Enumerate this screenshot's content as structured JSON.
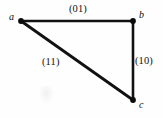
{
  "figure": {
    "background_color": "#fefefe",
    "stroke_color": "#111111",
    "vertex_color": "#0b0b0b"
  },
  "vertices": [
    {
      "id": "a",
      "label": "a",
      "x": 21,
      "y": 21
    },
    {
      "id": "b",
      "label": "b",
      "x": 133,
      "y": 21
    },
    {
      "id": "c",
      "label": "c",
      "x": 133,
      "y": 100
    }
  ],
  "edges": [
    {
      "id": "ab",
      "from": "a",
      "to": "b",
      "label": "(01)",
      "orientation": "horizontal"
    },
    {
      "id": "bc",
      "from": "b",
      "to": "c",
      "label": "(10)",
      "orientation": "vertical"
    },
    {
      "id": "ac",
      "from": "a",
      "to": "c",
      "label": "(11)",
      "orientation": "diagonal"
    }
  ],
  "chart_data": {
    "type": "diagram",
    "title": "",
    "nodes": [
      "a",
      "b",
      "c"
    ],
    "node_positions": {
      "a": [
        21,
        21
      ],
      "b": [
        133,
        21
      ],
      "c": [
        133,
        100
      ]
    },
    "edge_list": [
      [
        "a",
        "b"
      ],
      [
        "b",
        "c"
      ],
      [
        "a",
        "c"
      ]
    ],
    "edge_labels": {
      "a-b": "(01)",
      "b-c": "(10)",
      "a-c": "(11)"
    }
  }
}
